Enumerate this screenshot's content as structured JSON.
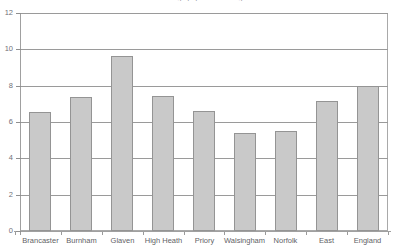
{
  "chart_data": {
    "type": "bar",
    "title": "Percentage population change",
    "categories": [
      "Brancaster",
      "Burnham",
      "Glaven",
      "High Heath",
      "Priory",
      "Walsingham",
      "Norfolk",
      "East",
      "England"
    ],
    "values": [
      6.55,
      7.4,
      9.65,
      7.45,
      6.6,
      5.4,
      5.5,
      7.15,
      8.0
    ],
    "xlabel": "",
    "ylabel": "",
    "ylim": [
      0,
      12
    ],
    "yticks": [
      0,
      2,
      4,
      6,
      8,
      10,
      12
    ],
    "ytick_labels": [
      "0",
      "2",
      "4",
      "6",
      "8",
      "10",
      "12"
    ],
    "grid": true,
    "grid_axis": "y",
    "legend": false,
    "bar_color": "#c9c9c9",
    "bar_edge_color": "#949494",
    "axis_color": "#a0a0a0",
    "grid_color": "#9a9a9a",
    "background": "#ffffff"
  }
}
